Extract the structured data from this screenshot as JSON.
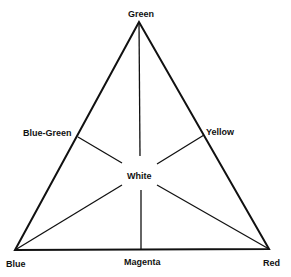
{
  "diagram": {
    "title": "",
    "type": "color-triangle",
    "colors": {
      "line": "#111111",
      "background": "#ffffff"
    },
    "vertices": {
      "green": {
        "label": "Green",
        "x": 139,
        "y": 22
      },
      "blue": {
        "label": "Blue",
        "x": 15,
        "y": 250
      },
      "red": {
        "label": "Red",
        "x": 269,
        "y": 249
      }
    },
    "midpoints": {
      "blue_green": {
        "label": "Blue-Green",
        "x": 78,
        "y": 137
      },
      "yellow": {
        "label": "Yellow",
        "x": 204,
        "y": 135
      },
      "magenta": {
        "label": "Magenta",
        "x": 141,
        "y": 250
      }
    },
    "center": {
      "label": "White",
      "x": 140,
      "y": 174
    }
  }
}
